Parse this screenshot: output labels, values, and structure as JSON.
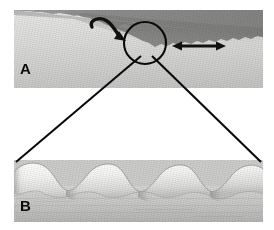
{
  "figure": {
    "background_color": "#ffffff",
    "width": 274,
    "height": 230
  },
  "panels": [
    {
      "id": "panel-a",
      "label": "A",
      "description": "Grayscale micrograph showing a dark upper layer with an irregular wavy interface sloping down to the left over a lighter lower layer",
      "bounds": {
        "x": 14,
        "y": 10,
        "width": 249,
        "height": 78
      },
      "colors": {
        "dark_layer": "#8e8e8c",
        "dark_layer_deep": "#767674",
        "light_layer": "#e0e0de",
        "light_layer_bottom": "#c3c3c1"
      },
      "annotations": [
        {
          "name": "curved-arrow",
          "type": "curved-arrow",
          "direction": "counterclockwise-to-right",
          "description": "Curved black arrow above the interface pointing right and down toward the circled region",
          "color": "#111111"
        },
        {
          "name": "double-headed-arrow",
          "type": "double-headed-arrow",
          "direction": "horizontal",
          "description": "Horizontal double-headed black arrow to the right of the circled region",
          "color": "#111111"
        },
        {
          "name": "region-of-interest-circle",
          "type": "circle",
          "description": "Black circle marking the region of interest that is magnified in panel B",
          "center_x": 145,
          "center_y": 43,
          "radius": 21,
          "color": "#0a0a0a"
        }
      ]
    },
    {
      "id": "panel-b",
      "label": "B",
      "description": "Magnified schematic of the interface showing a row of rounded scalloped lobes above a uniform gray substrate",
      "bounds": {
        "x": 14,
        "y": 160,
        "width": 249,
        "height": 62
      },
      "lobe_count": 5,
      "colors": {
        "lobe_light": "#fbfbfa",
        "lobe_shadow": "#b9b9b7",
        "substrate_top": "#d2d2d0",
        "substrate_bottom": "#b6b6b4",
        "outline": "#9a9a98"
      }
    }
  ],
  "connectors": {
    "name": "magnification-connector-lines",
    "description": "Two black lines diverging from the circled region in panel A to the top corners of panel B",
    "color": "#0a0a0a",
    "left_line": {
      "x1": 141,
      "y1": 57,
      "x2": 16,
      "y2": 163
    },
    "right_line": {
      "x1": 152,
      "y1": 57,
      "x2": 261,
      "y2": 163
    }
  },
  "labels": {
    "panel_a": "A",
    "panel_b": "B"
  }
}
